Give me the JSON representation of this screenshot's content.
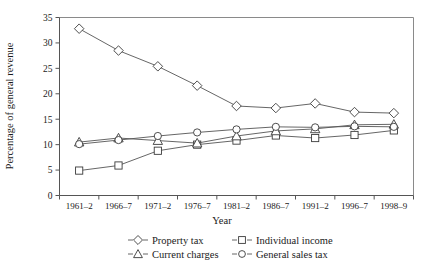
{
  "chart_data": {
    "type": "line",
    "title": "",
    "xlabel": "Year",
    "ylabel": "Percentage of general revenue",
    "categories": [
      "1961–2",
      "1966–7",
      "1971–2",
      "1976–7",
      "1981–2",
      "1986–7",
      "1991–2",
      "1996–7",
      "1998–9"
    ],
    "xtick_labels": [
      "1961–2",
      "1966–7",
      "1971–2",
      "1976–7",
      "1981–2",
      "1986–7",
      "1991–2",
      "1996–7",
      "1998–9"
    ],
    "ytick_labels": [
      "0",
      "5",
      "10",
      "15",
      "20",
      "25",
      "30",
      "35"
    ],
    "ytick_values": [
      0,
      5,
      10,
      15,
      20,
      25,
      30,
      35
    ],
    "ylim": [
      0,
      35
    ],
    "grid": false,
    "legend_position": "below",
    "series": [
      {
        "name": "Property tax",
        "marker": "diamond",
        "color": "#3a3a3a",
        "values": [
          32.8,
          28.5,
          25.4,
          21.6,
          17.6,
          17.2,
          18.1,
          16.4,
          16.2
        ]
      },
      {
        "name": "Individual income",
        "marker": "square",
        "color": "#3a3a3a",
        "values": [
          4.9,
          5.9,
          8.8,
          10.0,
          10.8,
          11.8,
          11.3,
          11.9,
          12.8
        ]
      },
      {
        "name": "Current charges",
        "marker": "triangle",
        "color": "#3a3a3a",
        "values": [
          10.5,
          11.3,
          10.8,
          10.3,
          11.7,
          12.7,
          13.1,
          13.9,
          14.0
        ]
      },
      {
        "name": "General sales tax",
        "marker": "circle",
        "color": "#3a3a3a",
        "values": [
          10.1,
          10.9,
          11.7,
          12.4,
          13.0,
          13.5,
          13.4,
          13.6,
          13.5
        ]
      }
    ]
  },
  "legend": {
    "entries": [
      {
        "label": "Property tax",
        "marker": "diamond"
      },
      {
        "label": "Individual income",
        "marker": "square"
      },
      {
        "label": "Current charges",
        "marker": "triangle"
      },
      {
        "label": "General sales tax",
        "marker": "circle"
      }
    ]
  },
  "axes": {
    "x_title": "Year",
    "y_title": "Percentage of general revenue"
  }
}
